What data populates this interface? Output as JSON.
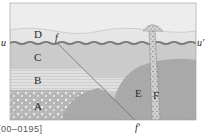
{
  "diagram": {
    "type": "geologic-cross-section",
    "layers": [
      {
        "id": "A",
        "label": "A",
        "description": "conglomerate layer (bottom)",
        "color": "#b8b8b8"
      },
      {
        "id": "B",
        "label": "B",
        "description": "laminated layer",
        "color": "#dcdcdc"
      },
      {
        "id": "C",
        "label": "C",
        "description": "layer",
        "color": "#c8c8c8"
      },
      {
        "id": "D",
        "label": "D",
        "description": "top layer above unconformity",
        "color": "#e4e4e4"
      },
      {
        "id": "E",
        "label": "E",
        "description": "intrusion",
        "color": "#a8a8a8"
      },
      {
        "id": "F",
        "label": "F",
        "description": "dike",
        "color": "#cfcfcf"
      }
    ],
    "markers": {
      "unconformity_left": "u",
      "unconformity_right": "u′",
      "fault_top": "f",
      "fault_bottom": "f′"
    },
    "sky_color": "#ececec"
  },
  "caption": "[00–0195]"
}
